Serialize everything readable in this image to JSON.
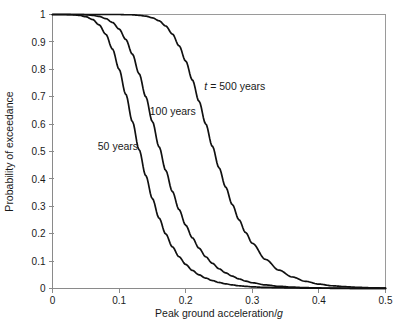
{
  "chart_data": {
    "type": "line",
    "title": "",
    "xlabel": "Peak ground acceleration/g",
    "xlabel_plain": "Peak ground acceleration/",
    "xlabel_italic": "g",
    "ylabel": "Probability of exceedance",
    "xlim": [
      0,
      0.5
    ],
    "ylim": [
      0,
      1
    ],
    "grid": false,
    "legend": "inline-annotations",
    "xticks": [
      0,
      0.1,
      0.2,
      0.3,
      0.4,
      0.5
    ],
    "xtick_labels": [
      "0",
      "0.1",
      "0.2",
      "0.3",
      "0.4",
      "0.5"
    ],
    "yticks": [
      0,
      0.1,
      0.2,
      0.3,
      0.4,
      0.5,
      0.6,
      0.7,
      0.8,
      0.9,
      1
    ],
    "ytick_labels": [
      "0",
      "0.1",
      "0.2",
      "0.3",
      "0.4",
      "0.5",
      "0.6",
      "0.7",
      "0.8",
      "0.9",
      "1"
    ],
    "line_color": "#111111",
    "axis_color": "#8a8a8a",
    "x": [
      0,
      0.01,
      0.02,
      0.03,
      0.04,
      0.05,
      0.06,
      0.07,
      0.08,
      0.09,
      0.1,
      0.11,
      0.12,
      0.13,
      0.14,
      0.15,
      0.16,
      0.17,
      0.18,
      0.19,
      0.2,
      0.21,
      0.22,
      0.23,
      0.24,
      0.25,
      0.26,
      0.27,
      0.28,
      0.29,
      0.3,
      0.32,
      0.34,
      0.36,
      0.38,
      0.4,
      0.42,
      0.44,
      0.46,
      0.48,
      0.5
    ],
    "series": [
      {
        "name": "50 years",
        "label": "50 years",
        "label_prefix": "",
        "t_years": 50,
        "label_x": 0.068,
        "label_y": 0.505,
        "values": [
          1.0,
          1.0,
          1.0,
          0.999,
          0.997,
          0.992,
          0.982,
          0.962,
          0.928,
          0.874,
          0.8,
          0.709,
          0.609,
          0.507,
          0.412,
          0.328,
          0.257,
          0.199,
          0.152,
          0.116,
          0.088,
          0.066,
          0.05,
          0.038,
          0.029,
          0.022,
          0.017,
          0.013,
          0.01,
          0.008,
          0.006,
          0.004,
          0.003,
          0.002,
          0.0015,
          0.001,
          0.0008,
          0.0006,
          0.0004,
          0.0003,
          0.0002
        ]
      },
      {
        "name": "100 years",
        "label": "100 years",
        "label_prefix": "",
        "t_years": 100,
        "label_x": 0.146,
        "label_y": 0.635,
        "values": [
          1.0,
          1.0,
          1.0,
          1.0,
          1.0,
          0.999,
          0.997,
          0.993,
          0.985,
          0.971,
          0.947,
          0.909,
          0.855,
          0.784,
          0.7,
          0.609,
          0.517,
          0.431,
          0.354,
          0.288,
          0.231,
          0.185,
          0.147,
          0.116,
          0.092,
          0.072,
          0.057,
          0.045,
          0.035,
          0.027,
          0.021,
          0.013,
          0.008,
          0.005,
          0.003,
          0.002,
          0.0013,
          0.0009,
          0.0006,
          0.0004,
          0.0003
        ]
      },
      {
        "name": "500 years",
        "label": "t = 500 years",
        "label_prefix": "t = ",
        "t_years": 500,
        "label_x": 0.228,
        "label_y": 0.725,
        "values": [
          1.0,
          1.0,
          1.0,
          1.0,
          1.0,
          1.0,
          1.0,
          1.0,
          1.0,
          1.0,
          1.0,
          0.999,
          0.999,
          0.997,
          0.994,
          0.988,
          0.977,
          0.958,
          0.929,
          0.886,
          0.83,
          0.761,
          0.683,
          0.601,
          0.519,
          0.441,
          0.37,
          0.306,
          0.251,
          0.204,
          0.165,
          0.106,
          0.067,
          0.042,
          0.026,
          0.016,
          0.01,
          0.0065,
          0.004,
          0.0025,
          0.0015
        ]
      }
    ]
  }
}
